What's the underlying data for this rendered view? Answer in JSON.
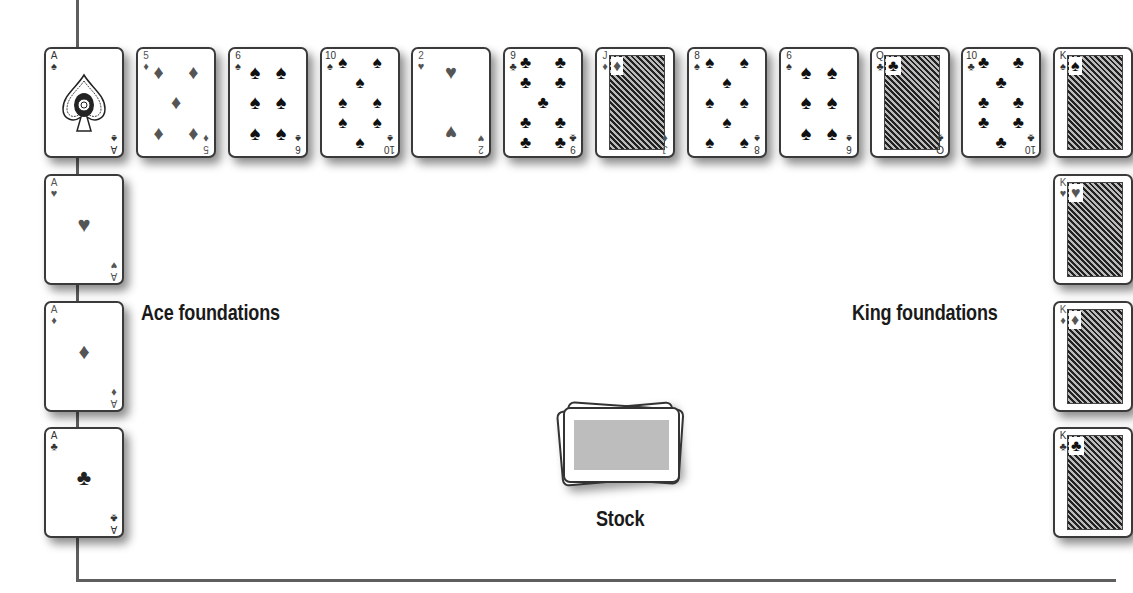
{
  "labels": {
    "ace_foundations": "Ace foundations",
    "king_foundations": "King foundations",
    "stock": "Stock"
  },
  "colors": {
    "frame": "#5e5e5e",
    "card_border": "#3a3a3a",
    "black_suit": "#111111",
    "red_suit": "#555555",
    "stock_back": "#bdbdbd"
  },
  "tableau_top_row": [
    {
      "rank": "A",
      "suit": "♠",
      "color": "black"
    },
    {
      "rank": "5",
      "suit": "♦",
      "color": "red"
    },
    {
      "rank": "6",
      "suit": "♠",
      "color": "black"
    },
    {
      "rank": "10",
      "suit": "♠",
      "color": "black"
    },
    {
      "rank": "2",
      "suit": "♥",
      "color": "red"
    },
    {
      "rank": "9",
      "suit": "♣",
      "color": "black"
    },
    {
      "rank": "J",
      "suit": "♦",
      "color": "red"
    },
    {
      "rank": "8",
      "suit": "♠",
      "color": "black"
    },
    {
      "rank": "6",
      "suit": "♠",
      "color": "black"
    },
    {
      "rank": "Q",
      "suit": "♣",
      "color": "black"
    },
    {
      "rank": "10",
      "suit": "♣",
      "color": "black"
    },
    {
      "rank": "K",
      "suit": "♠",
      "color": "black"
    }
  ],
  "ace_foundations": [
    {
      "rank": "A",
      "suit": "♥",
      "color": "red"
    },
    {
      "rank": "A",
      "suit": "♦",
      "color": "red"
    },
    {
      "rank": "A",
      "suit": "♣",
      "color": "black"
    }
  ],
  "king_foundations": [
    {
      "rank": "K",
      "suit": "♥",
      "color": "red"
    },
    {
      "rank": "K",
      "suit": "♦",
      "color": "red"
    },
    {
      "rank": "K",
      "suit": "♣",
      "color": "black"
    }
  ]
}
